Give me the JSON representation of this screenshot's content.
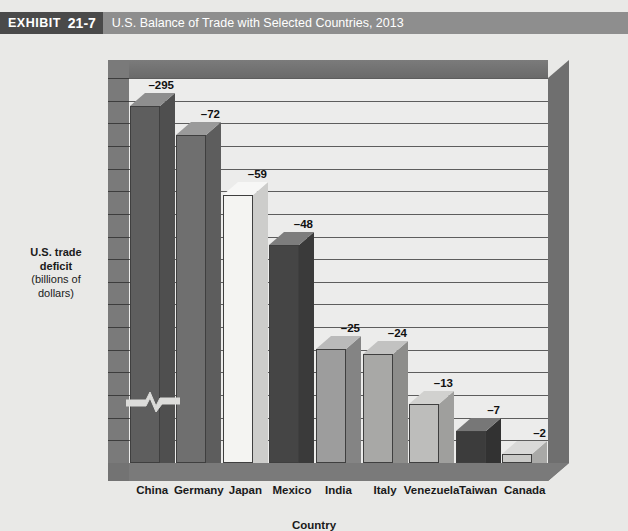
{
  "header": {
    "tag_word": "EXHIBIT",
    "tag_number": "21-7",
    "title": "U.S. Balance of Trade with Selected Countries, 2013",
    "band_color": "#8e8e8e",
    "tag_color": "#4a4a4a"
  },
  "chart_data": {
    "type": "bar",
    "title": "U.S. Balance of Trade with Selected Countries, 2013",
    "xlabel": "Country",
    "ylabel": "U.S. trade deficit (billions of dollars)",
    "ylabel_line1": "U.S. trade",
    "ylabel_line2": "deficit",
    "ylabel_line3": "(billions of",
    "ylabel_line4": "dollars)",
    "categories": [
      "China",
      "Germany",
      "Japan",
      "Mexico",
      "India",
      "Italy",
      "Venezuela",
      "Taiwan",
      "Canada"
    ],
    "values": [
      -295,
      -72,
      -59,
      -48,
      -25,
      -24,
      -13,
      -7,
      -2
    ],
    "data_labels": [
      "–295",
      "–72",
      "–59",
      "–48",
      "–25",
      "–24",
      "–13",
      "–7",
      "–2"
    ],
    "bar_colors": [
      "#5e5e5e",
      "#6f6f6f",
      "#f4f4f2",
      "#454545",
      "#9d9d9d",
      "#a8a8a6",
      "#bdbdbb",
      "#3c3c3c",
      "#c9c9c7"
    ],
    "grid": true,
    "gridline_count": 17,
    "axis_break": true,
    "axis_break_note": "scale break drawn across the China bar",
    "legend": "none",
    "ylim": [
      -80,
      0
    ],
    "display_note": "bars plotted on a broken scale; China bar truncated"
  },
  "axes": {
    "x_title": "Country"
  }
}
